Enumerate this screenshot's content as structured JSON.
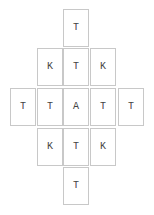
{
  "board": {
    "rows": [
      {
        "cards": [
          {
            "letter": "T"
          }
        ]
      },
      {
        "cards": [
          {
            "letter": "K"
          },
          {
            "letter": "T"
          },
          {
            "letter": "K"
          }
        ]
      },
      {
        "cards": [
          {
            "letter": "T"
          },
          {
            "letter": "T"
          },
          {
            "letter": "A"
          },
          {
            "letter": "T"
          },
          {
            "letter": "T"
          }
        ]
      },
      {
        "cards": [
          {
            "letter": "K"
          },
          {
            "letter": "T"
          },
          {
            "letter": "K"
          }
        ]
      },
      {
        "cards": [
          {
            "letter": "T"
          }
        ]
      }
    ]
  },
  "colors": {
    "card_border": "#c8c8c8",
    "card_background": "#ffffff",
    "letter": "#444444"
  }
}
